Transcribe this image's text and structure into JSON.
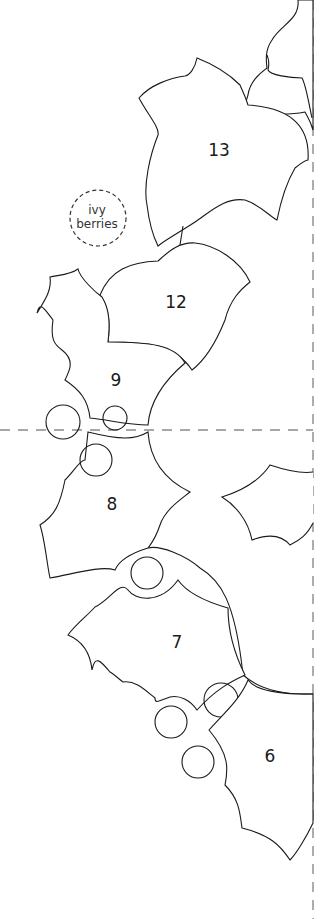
{
  "template": {
    "labels": {
      "leaf_13": "13",
      "leaf_12": "12",
      "leaf_9": "9",
      "leaf_8": "8",
      "leaf_7": "7",
      "leaf_6": "6"
    },
    "ivy_berries": {
      "line1": "ivy",
      "line2": "berries"
    }
  },
  "colors": {
    "outline": "#1a1a1a",
    "fold_line": "#8a8a8a",
    "background": "#ffffff"
  }
}
